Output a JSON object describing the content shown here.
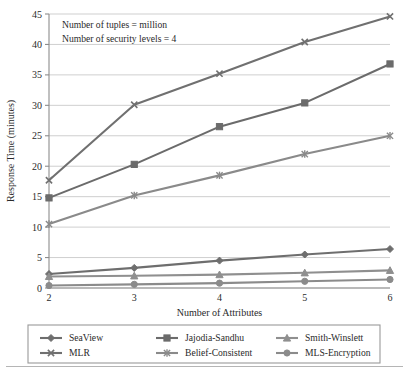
{
  "chart_data": {
    "type": "line",
    "title": "",
    "xlabel": "Number of Attributes",
    "ylabel": "Response Time (minutes)",
    "x": [
      2,
      3,
      4,
      5,
      6
    ],
    "xtick_labels": [
      "2",
      "3",
      "4",
      "5",
      "6"
    ],
    "ytick_labels": [
      "0",
      "5",
      "10",
      "15",
      "20",
      "25",
      "30",
      "35",
      "40",
      "45"
    ],
    "xlim": [
      2,
      6
    ],
    "ylim": [
      0,
      45
    ],
    "ytick_step": 5,
    "grid": "horizontal",
    "legend_position": "bottom",
    "legend_columns": 3,
    "annotations": [
      "Number of tuples = million",
      "Number of security levels = 4"
    ],
    "series": [
      {
        "name": "SeaView",
        "marker": "plus-diamond",
        "color": "#6e6e6e",
        "values": [
          2.3,
          3.3,
          4.5,
          5.5,
          6.4
        ]
      },
      {
        "name": "Jajodia-Sandhu",
        "marker": "square",
        "color": "#6b6b6b",
        "values": [
          14.8,
          20.3,
          26.5,
          30.4,
          36.8
        ]
      },
      {
        "name": "Smith-Winslett",
        "marker": "triangle",
        "color": "#8f8f8f",
        "values": [
          1.9,
          2.0,
          2.2,
          2.5,
          2.9
        ]
      },
      {
        "name": "MLR",
        "marker": "x",
        "color": "#707070",
        "values": [
          17.7,
          30.1,
          35.2,
          40.4,
          44.6
        ]
      },
      {
        "name": "Belief-Consistent",
        "marker": "asterisk",
        "color": "#8a8a8a",
        "values": [
          10.5,
          15.2,
          18.5,
          22.0,
          25.0
        ]
      },
      {
        "name": "MLS-Encryption",
        "marker": "circle",
        "color": "#8b8b8b",
        "values": [
          0.4,
          0.6,
          0.8,
          1.1,
          1.4
        ]
      }
    ]
  },
  "legend": {
    "items": [
      {
        "label": "SeaView",
        "marker": "plus-diamond",
        "color": "#6e6e6e"
      },
      {
        "label": "Jajodia-Sandhu",
        "marker": "square",
        "color": "#6b6b6b"
      },
      {
        "label": "Smith-Winslett",
        "marker": "triangle",
        "color": "#8f8f8f"
      },
      {
        "label": "MLR",
        "marker": "x",
        "color": "#707070"
      },
      {
        "label": "Belief-Consistent",
        "marker": "asterisk",
        "color": "#8a8a8a"
      },
      {
        "label": "MLS-Encryption",
        "marker": "circle",
        "color": "#8b8b8b"
      }
    ]
  }
}
